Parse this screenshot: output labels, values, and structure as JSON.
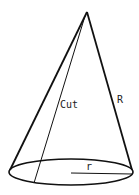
{
  "diagram": {
    "type": "cone",
    "labels": {
      "cut": "Cut",
      "slant": "R",
      "radius": "r"
    },
    "stroke_color": "#111111"
  }
}
